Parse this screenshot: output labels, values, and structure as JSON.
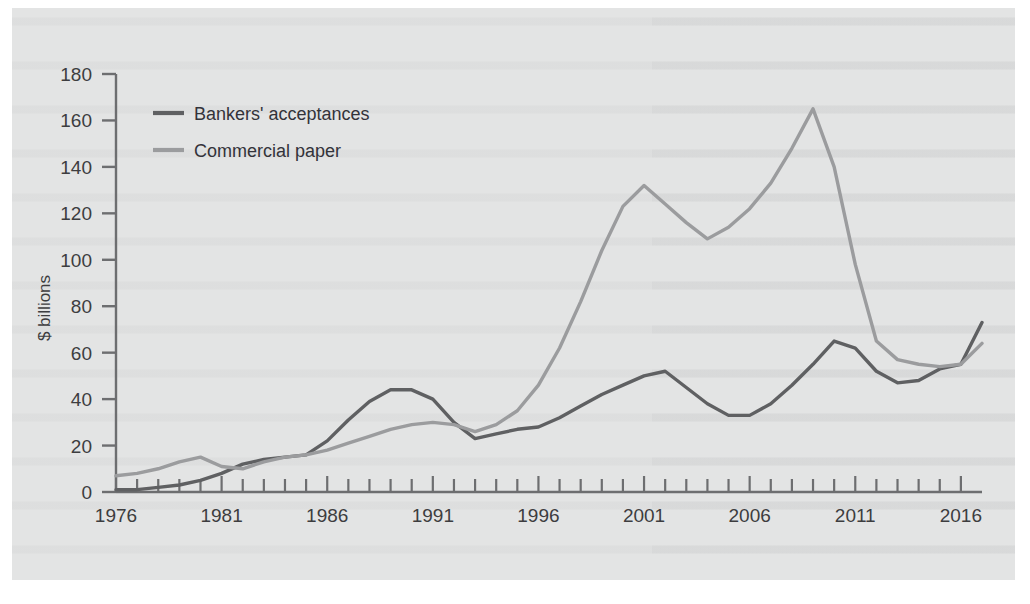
{
  "chart_data": {
    "type": "line",
    "title": "",
    "xlabel": "",
    "ylabel": "$ billions",
    "xlim": [
      1976,
      2016
    ],
    "ylim": [
      0,
      180
    ],
    "ytick_labels": [
      "0",
      "20",
      "40",
      "60",
      "80",
      "100",
      "120",
      "140",
      "160",
      "180"
    ],
    "yticks": [
      0,
      20,
      40,
      60,
      80,
      100,
      120,
      140,
      160,
      180
    ],
    "xtick_labels": [
      "1976",
      "1981",
      "1986",
      "1991",
      "1996",
      "2001",
      "2006",
      "2011",
      "2016"
    ],
    "xticks": [
      1976,
      1981,
      1986,
      1991,
      1996,
      2001,
      2006,
      2011,
      2016
    ],
    "minor_xtick_interval": 1,
    "grid": false,
    "legend_position": "top-left",
    "x": [
      1976,
      1977,
      1978,
      1979,
      1980,
      1981,
      1982,
      1983,
      1984,
      1985,
      1986,
      1987,
      1988,
      1989,
      1990,
      1991,
      1992,
      1993,
      1994,
      1995,
      1996,
      1997,
      1998,
      1999,
      2000,
      2001,
      2002,
      2003,
      2004,
      2005,
      2006,
      2007,
      2008,
      2009,
      2010,
      2011,
      2012,
      2013,
      2014,
      2015,
      2016
    ],
    "series": [
      {
        "name": "Bankers' acceptances",
        "color": "#5f6062",
        "values": [
          1,
          1,
          2,
          3,
          5,
          8,
          12,
          14,
          15,
          16,
          22,
          31,
          39,
          44,
          44,
          40,
          30,
          23,
          25,
          27,
          28,
          32,
          37,
          42,
          46,
          50,
          52,
          45,
          38,
          33,
          33,
          38,
          46,
          55,
          65,
          62,
          52,
          47,
          48,
          53,
          55
        ],
        "endpoints_note": "2016 value 73"
      },
      {
        "name": "Commercial paper",
        "color": "#9b9c9e",
        "values": [
          7,
          8,
          10,
          13,
          15,
          11,
          10,
          13,
          15,
          16,
          18,
          21,
          24,
          27,
          29,
          30,
          29,
          26,
          29,
          35,
          46,
          62,
          82,
          104,
          123,
          132,
          124,
          116,
          109,
          114,
          122,
          133,
          148,
          165,
          140,
          98,
          65,
          57,
          55,
          54,
          55
        ],
        "endpoints_note": "2016 value 64"
      }
    ],
    "series_full": [
      {
        "name": "Bankers' acceptances",
        "color": "#5f6062",
        "points": [
          [
            1976,
            1
          ],
          [
            1977,
            1
          ],
          [
            1978,
            2
          ],
          [
            1979,
            3
          ],
          [
            1980,
            5
          ],
          [
            1981,
            8
          ],
          [
            1982,
            12
          ],
          [
            1983,
            14
          ],
          [
            1984,
            15
          ],
          [
            1985,
            16
          ],
          [
            1986,
            22
          ],
          [
            1987,
            31
          ],
          [
            1988,
            39
          ],
          [
            1989,
            44
          ],
          [
            1990,
            44
          ],
          [
            1991,
            40
          ],
          [
            1992,
            30
          ],
          [
            1993,
            23
          ],
          [
            1994,
            25
          ],
          [
            1995,
            27
          ],
          [
            1996,
            28
          ],
          [
            1997,
            32
          ],
          [
            1998,
            37
          ],
          [
            1999,
            42
          ],
          [
            2000,
            46
          ],
          [
            2001,
            50
          ],
          [
            2002,
            52
          ],
          [
            2003,
            45
          ],
          [
            2004,
            38
          ],
          [
            2005,
            33
          ],
          [
            2006,
            33
          ],
          [
            2007,
            38
          ],
          [
            2008,
            46
          ],
          [
            2009,
            55
          ],
          [
            2010,
            65
          ],
          [
            2011,
            62
          ],
          [
            2012,
            52
          ],
          [
            2013,
            47
          ],
          [
            2014,
            48
          ],
          [
            2015,
            53
          ],
          [
            2016,
            55
          ],
          [
            2017,
            73
          ]
        ]
      },
      {
        "name": "Commercial paper",
        "color": "#9b9c9e",
        "points": [
          [
            1976,
            7
          ],
          [
            1977,
            8
          ],
          [
            1978,
            10
          ],
          [
            1979,
            13
          ],
          [
            1980,
            15
          ],
          [
            1981,
            11
          ],
          [
            1982,
            10
          ],
          [
            1983,
            13
          ],
          [
            1984,
            15
          ],
          [
            1985,
            16
          ],
          [
            1986,
            18
          ],
          [
            1987,
            21
          ],
          [
            1988,
            24
          ],
          [
            1989,
            27
          ],
          [
            1990,
            29
          ],
          [
            1991,
            30
          ],
          [
            1992,
            29
          ],
          [
            1993,
            26
          ],
          [
            1994,
            29
          ],
          [
            1995,
            35
          ],
          [
            1996,
            46
          ],
          [
            1997,
            62
          ],
          [
            1998,
            82
          ],
          [
            1999,
            104
          ],
          [
            2000,
            123
          ],
          [
            2001,
            132
          ],
          [
            2002,
            124
          ],
          [
            2003,
            116
          ],
          [
            2004,
            109
          ],
          [
            2005,
            114
          ],
          [
            2006,
            122
          ],
          [
            2007,
            133
          ],
          [
            2008,
            148
          ],
          [
            2009,
            165
          ],
          [
            2010,
            140
          ],
          [
            2011,
            98
          ],
          [
            2012,
            65
          ],
          [
            2013,
            57
          ],
          [
            2014,
            55
          ],
          [
            2015,
            54
          ],
          [
            2016,
            55
          ],
          [
            2017,
            64
          ]
        ]
      }
    ]
  },
  "legend": {
    "items": [
      {
        "label": "Bankers' acceptances",
        "color": "#5f6062"
      },
      {
        "label": "Commercial paper",
        "color": "#9b9c9e"
      }
    ]
  },
  "axes": {
    "y_axis_title": "$ billions",
    "y_tick_labels": [
      "180",
      "160",
      "140",
      "120",
      "100",
      "80",
      "60",
      "40",
      "20",
      "0"
    ],
    "x_tick_labels": [
      "1976",
      "1981",
      "1986",
      "1991",
      "1996",
      "2001",
      "2006",
      "2011",
      "2016"
    ]
  },
  "colors": {
    "panel_background": "#e3e4e4",
    "page_background": "#ffffff",
    "axis": "#6d6e70",
    "text": "#3d3d3f",
    "series_bankers": "#5f6062",
    "series_commercial": "#9b9c9e"
  }
}
